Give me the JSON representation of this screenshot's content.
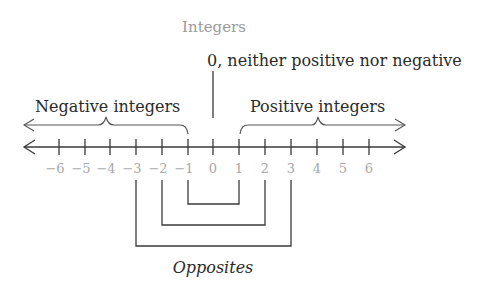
{
  "title": "Integers",
  "zero_label": "0, neither positive nor negative",
  "negative_label": "Negative integers",
  "positive_label": "Positive integers",
  "opposites_label": "Opposites",
  "number_line": {
    "ticks": [
      "−6",
      "−5",
      "−4",
      "−3",
      "−2",
      "−1",
      "0",
      "1",
      "2",
      "3",
      "4",
      "5",
      "6"
    ]
  },
  "opposite_pairs": [
    {
      "a": "−1",
      "b": "1"
    },
    {
      "a": "−2",
      "b": "2"
    },
    {
      "a": "−3",
      "b": "3"
    }
  ],
  "colors": {
    "line": "#3a3a3a",
    "title": "#9a9a9a",
    "tick_label": "#a8a8a8"
  }
}
